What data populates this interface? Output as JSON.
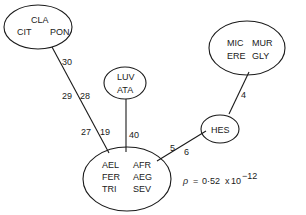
{
  "nodes": [
    {
      "id": "cla-group",
      "labels": [
        "CLA",
        "CIT",
        "PON"
      ]
    },
    {
      "id": "mic-group",
      "labels": [
        "MIC",
        "MUR",
        "ERE",
        "GLY"
      ]
    },
    {
      "id": "luv-group",
      "labels": [
        "LUV",
        "ATA"
      ]
    },
    {
      "id": "hes",
      "labels": [
        "HES"
      ]
    },
    {
      "id": "ael-group",
      "labels": [
        "AEL",
        "AFR",
        "FER",
        "AEG",
        "TRI",
        "SEV"
      ]
    }
  ],
  "edges": [
    {
      "from": "cla-group",
      "to": "ael-group",
      "labels": [
        "30",
        "29",
        "28",
        "27",
        "19"
      ]
    },
    {
      "from": "luv-group",
      "to": "ael-group",
      "labels": [
        "40"
      ]
    },
    {
      "from": "mic-group",
      "to": "hes",
      "labels": [
        "4"
      ]
    },
    {
      "from": "hes",
      "to": "ael-group",
      "labels": [
        "5",
        "6"
      ]
    }
  ],
  "formula": {
    "symbol": "ρ",
    "equals": "=",
    "mantissa": "0·52",
    "times": "x",
    "base": "10",
    "exponent": "−12"
  }
}
